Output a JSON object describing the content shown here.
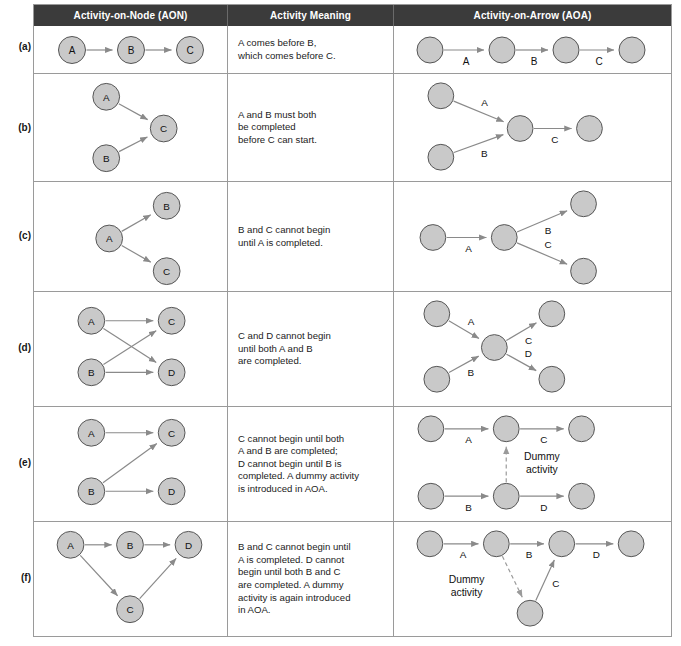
{
  "figure": {
    "kind": "comparison-table",
    "columns": [
      {
        "key": "aon",
        "label": "Activity-on-Node (AON)"
      },
      {
        "key": "meaning",
        "label": "Activity Meaning"
      },
      {
        "key": "aoa",
        "label": "Activity-on-Arrow (AOA)"
      }
    ],
    "colors": {
      "header_bg": "#3b3b3b",
      "header_text": "#ffffff",
      "grid": "#9a9a9a",
      "node_fill": "#c9c9c9",
      "node_stroke": "#555555",
      "arrow": "#8a8a8a",
      "text": "#111111",
      "page_bg": "#ffffff"
    },
    "rows": [
      {
        "id": "a",
        "label": "(a)",
        "meaning_lines": [
          "A comes before B,",
          "which comes before C."
        ],
        "aon": {
          "nodes": [
            {
              "id": "A",
              "label": "A",
              "x": 38,
              "y": 24
            },
            {
              "id": "B",
              "label": "B",
              "x": 97,
              "y": 24
            },
            {
              "id": "C",
              "label": "C",
              "x": 156,
              "y": 24
            }
          ],
          "edges": [
            {
              "from": "A",
              "to": "B"
            },
            {
              "from": "B",
              "to": "C"
            }
          ]
        },
        "aoa": {
          "nodes": [
            {
              "id": "n1",
              "x": 36,
              "y": 24
            },
            {
              "id": "n2",
              "x": 108,
              "y": 24
            },
            {
              "id": "n3",
              "x": 172,
              "y": 24
            },
            {
              "id": "n4",
              "x": 238,
              "y": 24
            }
          ],
          "edges": [
            {
              "from": "n1",
              "to": "n2",
              "label": "A"
            },
            {
              "from": "n2",
              "to": "n3",
              "label": "B"
            },
            {
              "from": "n3",
              "to": "n4",
              "label": "C"
            }
          ]
        }
      },
      {
        "id": "b",
        "label": "(b)",
        "meaning_lines": [
          "A and B must both",
          "be completed",
          "before C can start."
        ],
        "aon": {
          "nodes": [
            {
              "id": "A",
              "label": "A",
              "x": 72,
              "y": 23
            },
            {
              "id": "B",
              "label": "B",
              "x": 72,
              "y": 85
            },
            {
              "id": "C",
              "label": "C",
              "x": 130,
              "y": 55
            }
          ],
          "edges": [
            {
              "from": "A",
              "to": "C"
            },
            {
              "from": "B",
              "to": "C"
            }
          ]
        },
        "aoa": {
          "nodes": [
            {
              "id": "n1",
              "x": 46,
              "y": 22
            },
            {
              "id": "n2",
              "x": 46,
              "y": 84
            },
            {
              "id": "n3",
              "x": 126,
              "y": 55
            },
            {
              "id": "n4",
              "x": 196,
              "y": 55
            }
          ],
          "edges": [
            {
              "from": "n1",
              "to": "n3",
              "label": "A"
            },
            {
              "from": "n2",
              "to": "n3",
              "label": "B"
            },
            {
              "from": "n3",
              "to": "n4",
              "label": "C"
            }
          ]
        }
      },
      {
        "id": "c",
        "label": "(c)",
        "meaning_lines": [
          "B and C cannot begin",
          "until A is completed."
        ],
        "aon": {
          "nodes": [
            {
              "id": "A",
              "label": "A",
              "x": 75,
              "y": 57
            },
            {
              "id": "B",
              "label": "B",
              "x": 133,
              "y": 24
            },
            {
              "id": "C",
              "label": "C",
              "x": 133,
              "y": 90
            }
          ],
          "edges": [
            {
              "from": "A",
              "to": "B"
            },
            {
              "from": "A",
              "to": "C"
            }
          ]
        },
        "aoa": {
          "nodes": [
            {
              "id": "n1",
              "x": 38,
              "y": 56
            },
            {
              "id": "n2",
              "x": 110,
              "y": 56
            },
            {
              "id": "n3",
              "x": 190,
              "y": 22
            },
            {
              "id": "n4",
              "x": 190,
              "y": 90
            }
          ],
          "edges": [
            {
              "from": "n1",
              "to": "n2",
              "label": "A"
            },
            {
              "from": "n2",
              "to": "n3",
              "label": "B"
            },
            {
              "from": "n2",
              "to": "n4",
              "label": "C"
            }
          ]
        }
      },
      {
        "id": "d",
        "label": "(d)",
        "meaning_lines": [
          "C and D cannot begin",
          "until both A and B",
          "are completed."
        ],
        "aon": {
          "nodes": [
            {
              "id": "A",
              "label": "A",
              "x": 57,
              "y": 29
            },
            {
              "id": "B",
              "label": "B",
              "x": 57,
              "y": 81
            },
            {
              "id": "C",
              "label": "C",
              "x": 138,
              "y": 29
            },
            {
              "id": "D",
              "label": "D",
              "x": 138,
              "y": 81
            }
          ],
          "edges": [
            {
              "from": "A",
              "to": "C"
            },
            {
              "from": "A",
              "to": "D"
            },
            {
              "from": "B",
              "to": "C"
            },
            {
              "from": "B",
              "to": "D"
            }
          ]
        },
        "aoa": {
          "nodes": [
            {
              "id": "n1",
              "x": 42,
              "y": 22
            },
            {
              "id": "n2",
              "x": 42,
              "y": 88
            },
            {
              "id": "n3",
              "x": 100,
              "y": 56
            },
            {
              "id": "n4",
              "x": 158,
              "y": 22
            },
            {
              "id": "n5",
              "x": 158,
              "y": 88
            }
          ],
          "edges": [
            {
              "from": "n1",
              "to": "n3",
              "label": "A"
            },
            {
              "from": "n2",
              "to": "n3",
              "label": "B"
            },
            {
              "from": "n3",
              "to": "n4",
              "label": "C"
            },
            {
              "from": "n3",
              "to": "n5",
              "label": "D"
            }
          ]
        }
      },
      {
        "id": "e",
        "label": "(e)",
        "meaning_lines": [
          "C cannot begin until both",
          "A and B are completed;",
          "D cannot begin until B is",
          "completed. A dummy activity",
          "is introduced in AOA."
        ],
        "aon": {
          "nodes": [
            {
              "id": "A",
              "label": "A",
              "x": 57,
              "y": 26
            },
            {
              "id": "B",
              "label": "B",
              "x": 57,
              "y": 85
            },
            {
              "id": "C",
              "label": "C",
              "x": 138,
              "y": 26
            },
            {
              "id": "D",
              "label": "D",
              "x": 138,
              "y": 85
            }
          ],
          "edges": [
            {
              "from": "A",
              "to": "C"
            },
            {
              "from": "B",
              "to": "C"
            },
            {
              "from": "B",
              "to": "D"
            }
          ]
        },
        "aoa": {
          "nodes": [
            {
              "id": "n1",
              "x": 36,
              "y": 22
            },
            {
              "id": "n2",
              "x": 112,
              "y": 22
            },
            {
              "id": "n3",
              "x": 188,
              "y": 22
            },
            {
              "id": "n4",
              "x": 36,
              "y": 90
            },
            {
              "id": "n5",
              "x": 112,
              "y": 90
            },
            {
              "id": "n6",
              "x": 188,
              "y": 90
            }
          ],
          "edges": [
            {
              "from": "n1",
              "to": "n2",
              "label": "A"
            },
            {
              "from": "n2",
              "to": "n3",
              "label": "C"
            },
            {
              "from": "n4",
              "to": "n5",
              "label": "B"
            },
            {
              "from": "n5",
              "to": "n6",
              "label": "D"
            }
          ],
          "dummy": {
            "from": "n5",
            "to": "n2",
            "label_lines": [
              "Dummy",
              "activity"
            ],
            "label_x": 148,
            "label_y": 50
          }
        }
      },
      {
        "id": "f",
        "label": "(f)",
        "meaning_lines": [
          "B and C cannot begin until",
          "A is completed. D cannot",
          "begin until both B and C",
          "are completed. A dummy",
          "activity is again introduced",
          "in AOA."
        ],
        "aon": {
          "nodes": [
            {
              "id": "A",
              "label": "A",
              "x": 36,
              "y": 23
            },
            {
              "id": "B",
              "label": "B",
              "x": 96,
              "y": 23
            },
            {
              "id": "D",
              "label": "D",
              "x": 155,
              "y": 23
            },
            {
              "id": "C",
              "label": "C",
              "x": 96,
              "y": 88
            }
          ],
          "edges": [
            {
              "from": "A",
              "to": "B"
            },
            {
              "from": "B",
              "to": "D"
            },
            {
              "from": "A",
              "to": "C"
            },
            {
              "from": "C",
              "to": "D"
            }
          ]
        },
        "aoa": {
          "nodes": [
            {
              "id": "n1",
              "x": 35,
              "y": 22
            },
            {
              "id": "n2",
              "x": 102,
              "y": 22
            },
            {
              "id": "n3",
              "x": 168,
              "y": 22
            },
            {
              "id": "n4",
              "x": 238,
              "y": 22
            },
            {
              "id": "n5",
              "x": 136,
              "y": 92
            }
          ],
          "edges": [
            {
              "from": "n1",
              "to": "n2",
              "label": "A"
            },
            {
              "from": "n2",
              "to": "n3",
              "label": "B"
            },
            {
              "from": "n3",
              "to": "n4",
              "label": "D"
            },
            {
              "from": "n5",
              "to": "n3",
              "label": "C"
            }
          ],
          "dummy": {
            "from": "n2",
            "to": "n5",
            "label_lines": [
              "Dummy",
              "activity"
            ],
            "label_x": 72,
            "label_y": 58
          }
        }
      }
    ]
  }
}
